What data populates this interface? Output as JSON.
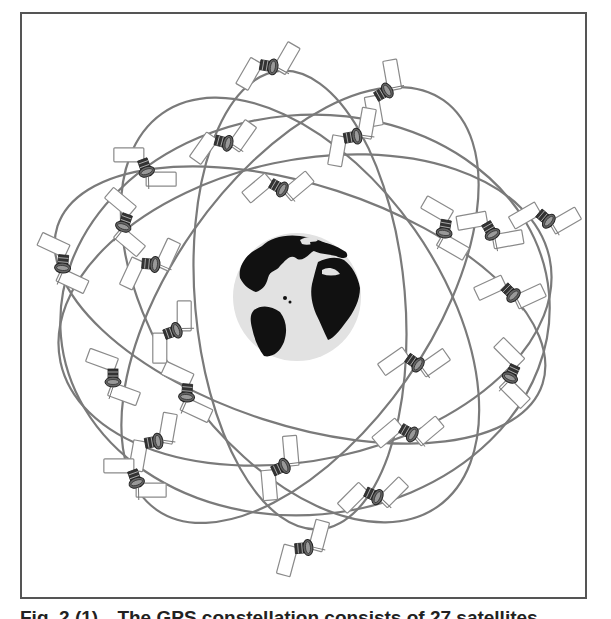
{
  "figure": {
    "caption_number": "Fig. 2 (1)",
    "caption_text": "The GPS constellation consists of 27 satellites",
    "colors": {
      "frame": "#555555",
      "orbit": "#7a7a7a",
      "ocean": "#e2e2e2",
      "land": "#111111",
      "solar_panel_fill": "#ffffff",
      "solar_panel_stroke": "#8a8a8a",
      "satellite_body": "#444444"
    },
    "globe": {
      "cx": 297,
      "cy": 297,
      "r": 64,
      "icon": "earth-globe-icon"
    },
    "orbits": [
      {
        "cx": 305,
        "cy": 310,
        "rx": 250,
        "ry": 150,
        "rotate": -12
      },
      {
        "cx": 300,
        "cy": 305,
        "rx": 255,
        "ry": 120,
        "rotate": 18
      },
      {
        "cx": 300,
        "cy": 310,
        "rx": 240,
        "ry": 140,
        "rotate": 55
      },
      {
        "cx": 300,
        "cy": 305,
        "rx": 250,
        "ry": 130,
        "rotate": -55
      },
      {
        "cx": 305,
        "cy": 315,
        "rx": 245,
        "ry": 200,
        "rotate": -5
      },
      {
        "cx": 300,
        "cy": 300,
        "rx": 230,
        "ry": 105,
        "rotate": 85
      }
    ],
    "satellites": [
      {
        "x": 268,
        "y": 66,
        "angle": 10
      },
      {
        "x": 383,
        "y": 93,
        "angle": -30
      },
      {
        "x": 223,
        "y": 142,
        "angle": 15
      },
      {
        "x": 352,
        "y": 137,
        "angle": -10
      },
      {
        "x": 145,
        "y": 167,
        "angle": 70
      },
      {
        "x": 278,
        "y": 187,
        "angle": 30
      },
      {
        "x": 125,
        "y": 222,
        "angle": 110
      },
      {
        "x": 445,
        "y": 228,
        "angle": 100
      },
      {
        "x": 490,
        "y": 230,
        "angle": 60
      },
      {
        "x": 545,
        "y": 218,
        "angle": 40
      },
      {
        "x": 63,
        "y": 263,
        "angle": 95
      },
      {
        "x": 150,
        "y": 264,
        "angle": 5
      },
      {
        "x": 510,
        "y": 292,
        "angle": 45
      },
      {
        "x": 172,
        "y": 332,
        "angle": -20
      },
      {
        "x": 414,
        "y": 362,
        "angle": 35
      },
      {
        "x": 113,
        "y": 377,
        "angle": 90
      },
      {
        "x": 187,
        "y": 392,
        "angle": 95
      },
      {
        "x": 512,
        "y": 373,
        "angle": 115
      },
      {
        "x": 408,
        "y": 432,
        "angle": 30
      },
      {
        "x": 153,
        "y": 442,
        "angle": -10
      },
      {
        "x": 135,
        "y": 478,
        "angle": 70
      },
      {
        "x": 280,
        "y": 468,
        "angle": -25
      },
      {
        "x": 373,
        "y": 495,
        "angle": 25
      },
      {
        "x": 303,
        "y": 548,
        "angle": -5
      }
    ]
  }
}
